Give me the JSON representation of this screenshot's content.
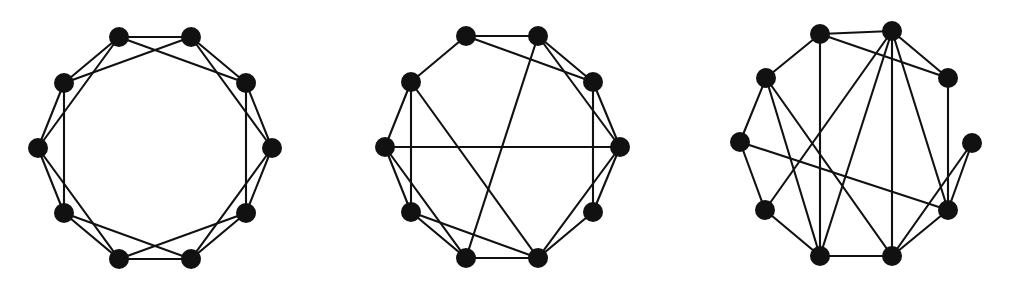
{
  "figure": {
    "title": "",
    "caption": "",
    "background_color": "#ffffff",
    "node_color": "#111111",
    "edge_color": "#111111",
    "node_radius": 10,
    "edge_width": 2.1,
    "panel_count": 3
  },
  "chart_data": {
    "type": "diagram",
    "subtype": "node-link-graph",
    "title": "",
    "xlabel": "",
    "ylabel": "",
    "grid": false,
    "legend": null,
    "shared": {
      "node_count": 10,
      "degree_k": 4,
      "layout": "circular",
      "node_indexing": "index 0 at top-left-of-top-pair, increasing clockwise"
    },
    "panels": [
      {
        "name": "regular",
        "label": "",
        "center": [
          155,
          148
        ],
        "radius": 117,
        "angle_offset_deg": -72,
        "rewired_edge_count": 0,
        "edge_count": 20,
        "nodes": [
          {
            "id": 0,
            "x": 119,
            "y": 37
          },
          {
            "id": 1,
            "x": 191,
            "y": 37
          },
          {
            "id": 2,
            "x": 246,
            "y": 83
          },
          {
            "id": 3,
            "x": 272,
            "y": 148
          },
          {
            "id": 4,
            "x": 246,
            "y": 213
          },
          {
            "id": 5,
            "x": 191,
            "y": 259
          },
          {
            "id": 6,
            "x": 119,
            "y": 259
          },
          {
            "id": 7,
            "x": 64,
            "y": 213
          },
          {
            "id": 8,
            "x": 38,
            "y": 148
          },
          {
            "id": 9,
            "x": 64,
            "y": 83
          }
        ],
        "edges": [
          [
            0,
            1
          ],
          [
            1,
            2
          ],
          [
            2,
            3
          ],
          [
            3,
            4
          ],
          [
            4,
            5
          ],
          [
            5,
            6
          ],
          [
            6,
            7
          ],
          [
            7,
            8
          ],
          [
            8,
            9
          ],
          [
            9,
            0
          ],
          [
            0,
            2
          ],
          [
            1,
            3
          ],
          [
            2,
            4
          ],
          [
            3,
            5
          ],
          [
            4,
            6
          ],
          [
            5,
            7
          ],
          [
            6,
            8
          ],
          [
            7,
            9
          ],
          [
            8,
            0
          ],
          [
            9,
            1
          ]
        ]
      },
      {
        "name": "small-world",
        "label": "",
        "center": [
          502,
          147
        ],
        "radius": 117,
        "angle_offset_deg": -72,
        "rewired_edge_count": 4,
        "edge_count": 20,
        "nodes": [
          {
            "id": 0,
            "x": 466,
            "y": 36
          },
          {
            "id": 1,
            "x": 538,
            "y": 36
          },
          {
            "id": 2,
            "x": 593,
            "y": 82
          },
          {
            "id": 3,
            "x": 620,
            "y": 147
          },
          {
            "id": 4,
            "x": 593,
            "y": 212
          },
          {
            "id": 5,
            "x": 538,
            "y": 258
          },
          {
            "id": 6,
            "x": 466,
            "y": 258
          },
          {
            "id": 7,
            "x": 411,
            "y": 212
          },
          {
            "id": 8,
            "x": 385,
            "y": 147
          },
          {
            "id": 9,
            "x": 411,
            "y": 82
          }
        ],
        "edges": [
          [
            0,
            1
          ],
          [
            1,
            2
          ],
          [
            2,
            3
          ],
          [
            3,
            4
          ],
          [
            4,
            5
          ],
          [
            5,
            6
          ],
          [
            6,
            7
          ],
          [
            7,
            8
          ],
          [
            8,
            9
          ],
          [
            9,
            0
          ],
          [
            0,
            2
          ],
          [
            1,
            3
          ],
          [
            2,
            4
          ],
          [
            3,
            5
          ],
          [
            5,
            7
          ],
          [
            6,
            8
          ],
          [
            7,
            9
          ],
          [
            8,
            3
          ],
          [
            1,
            6
          ],
          [
            9,
            5
          ]
        ]
      },
      {
        "name": "random",
        "label": "",
        "center": [
          856,
          143
        ],
        "radius": 116,
        "angle_offset_deg": -72,
        "rewired_edge_count": 10,
        "edge_count": 20,
        "nodes": [
          {
            "id": 0,
            "x": 820,
            "y": 34
          },
          {
            "id": 1,
            "x": 892,
            "y": 31
          },
          {
            "id": 2,
            "x": 948,
            "y": 78
          },
          {
            "id": 3,
            "x": 972,
            "y": 143
          },
          {
            "id": 4,
            "x": 948,
            "y": 210
          },
          {
            "id": 5,
            "x": 892,
            "y": 256
          },
          {
            "id": 6,
            "x": 820,
            "y": 256
          },
          {
            "id": 7,
            "x": 765,
            "y": 210
          },
          {
            "id": 8,
            "x": 740,
            "y": 142
          },
          {
            "id": 9,
            "x": 766,
            "y": 78
          }
        ],
        "edges": [
          [
            0,
            1
          ],
          [
            1,
            2
          ],
          [
            2,
            4
          ],
          [
            4,
            5
          ],
          [
            5,
            6
          ],
          [
            6,
            7
          ],
          [
            7,
            8
          ],
          [
            8,
            9
          ],
          [
            9,
            0
          ],
          [
            0,
            2
          ],
          [
            1,
            5
          ],
          [
            1,
            6
          ],
          [
            1,
            4
          ],
          [
            9,
            5
          ],
          [
            9,
            6
          ],
          [
            8,
            4
          ],
          [
            7,
            1
          ],
          [
            0,
            6
          ],
          [
            3,
            4
          ],
          [
            3,
            5
          ]
        ]
      }
    ]
  }
}
